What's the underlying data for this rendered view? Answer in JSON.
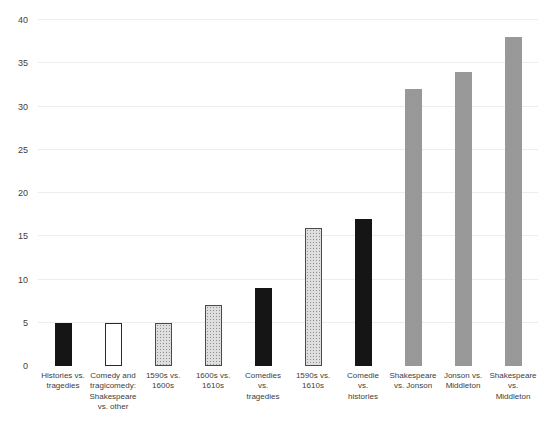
{
  "chart_data": {
    "type": "bar",
    "title": "",
    "xlabel": "",
    "ylabel": "",
    "ylim": [
      0,
      40
    ],
    "y_ticks": [
      40,
      35,
      30,
      25,
      20,
      15,
      10,
      5,
      0
    ],
    "gridlines_at": [
      5,
      10,
      15,
      20,
      25,
      30,
      35,
      40
    ],
    "grid": "horizontal-light",
    "legend": "none",
    "categories": [
      "Histories vs.\ntragedies",
      "Comedy and\ntragicomedy:\nShakespeare\nvs. other",
      "1590s vs.\n1600s",
      "1600s vs.\n1610s",
      "Comedies vs.\ntragedies",
      "1590s vs.\n1610s",
      "Comedie\nvs.\nhistories",
      "Shakespeare\nvs. Jonson",
      "Jonson vs.\nMiddleton",
      "Shakespeare\nvs.\nMiddleton"
    ],
    "values": [
      5,
      5,
      5,
      7,
      9,
      16,
      17,
      32,
      34,
      38
    ],
    "bar_styles": [
      "black",
      "white",
      "dotted",
      "dotted",
      "black",
      "dotted",
      "black",
      "gray",
      "gray",
      "gray"
    ]
  },
  "style": {
    "colors": {
      "black_bar": "#151515",
      "white_bar_fill": "#ffffff",
      "white_bar_border": "#2a2a2a",
      "dotted_bar_fill": "#dedede",
      "dotted_bar_dot": "#8f8f8f",
      "dotted_bar_border": "#4a4a4a",
      "gray_bar_fill": "#adadad",
      "gray_bar_dot": "#979797",
      "gridline": "#ededed",
      "axis_text": "#404040",
      "category_text": "#3d3d3d"
    }
  }
}
